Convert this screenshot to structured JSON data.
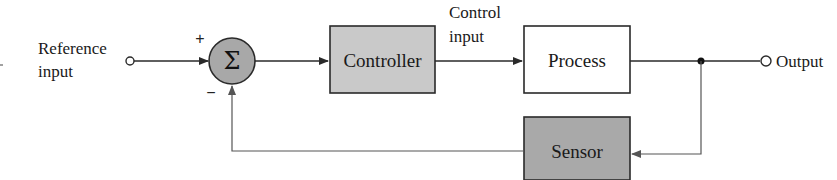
{
  "diagram": {
    "type": "feedback-control-block-diagram",
    "reference_input": {
      "line1": "Reference",
      "line2": "input"
    },
    "summing_junction": {
      "symbol": "Σ",
      "plus_sign": "+",
      "minus_sign": "−"
    },
    "controller": {
      "label": "Controller"
    },
    "control_input": {
      "line1": "Control",
      "line2": "input"
    },
    "process": {
      "label": "Process"
    },
    "output": {
      "label": "Output"
    },
    "sensor": {
      "label": "Sensor"
    }
  },
  "colors": {
    "line": "#2a2a2a",
    "feedback_line": "#555555",
    "controller_fill": "#c9c9c9",
    "sensor_fill": "#a9a9a9",
    "sum_fill": "#a8a8a8",
    "process_fill": "#ffffff"
  }
}
